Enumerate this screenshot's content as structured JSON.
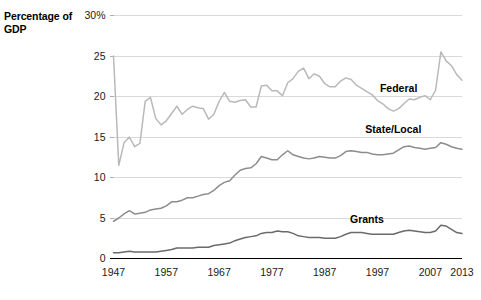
{
  "axis_title": "Percentage of GDP",
  "chart_data": {
    "type": "line",
    "title": "",
    "xlabel": "",
    "ylabel": "Percentage of GDP",
    "xlim": [
      1947,
      2013
    ],
    "ylim": [
      0,
      30
    ],
    "grid": true,
    "grid_axis": "y",
    "legend_position": "inline-labels",
    "y_ticks": [
      0,
      5,
      10,
      15,
      20,
      25,
      30
    ],
    "y_tick_labels": [
      "0",
      "5",
      "10",
      "15",
      "20",
      "25",
      "30%"
    ],
    "x_ticks": [
      1947,
      1957,
      1967,
      1977,
      1987,
      1997,
      2007,
      2013
    ],
    "x_tick_labels": [
      "1947",
      "1957",
      "1967",
      "1977",
      "1987",
      "1997",
      "2007",
      "2013"
    ],
    "x": [
      1947,
      1948,
      1949,
      1950,
      1951,
      1952,
      1953,
      1954,
      1955,
      1956,
      1957,
      1958,
      1959,
      1960,
      1961,
      1962,
      1963,
      1964,
      1965,
      1966,
      1967,
      1968,
      1969,
      1970,
      1971,
      1972,
      1973,
      1974,
      1975,
      1976,
      1977,
      1978,
      1979,
      1980,
      1981,
      1982,
      1983,
      1984,
      1985,
      1986,
      1987,
      1988,
      1989,
      1990,
      1991,
      1992,
      1993,
      1994,
      1995,
      1996,
      1997,
      1998,
      1999,
      2000,
      2001,
      2002,
      2003,
      2004,
      2005,
      2006,
      2007,
      2008,
      2009,
      2010,
      2011,
      2012,
      2013
    ],
    "series": [
      {
        "name": "Federal",
        "color": "#b9b9b9",
        "label_x": 2001,
        "label_y": 20.5,
        "values": [
          25.0,
          11.5,
          14.3,
          15.0,
          13.8,
          14.2,
          19.4,
          19.9,
          17.3,
          16.5,
          17.0,
          17.9,
          18.8,
          17.8,
          18.4,
          18.8,
          18.6,
          18.5,
          17.2,
          17.8,
          19.4,
          20.5,
          19.4,
          19.3,
          19.5,
          19.6,
          18.7,
          18.7,
          21.3,
          21.4,
          20.7,
          20.7,
          20.1,
          21.7,
          22.2,
          23.1,
          23.5,
          22.2,
          22.8,
          22.5,
          21.6,
          21.2,
          21.2,
          21.9,
          22.3,
          22.1,
          21.4,
          21.0,
          20.6,
          20.2,
          19.5,
          19.1,
          18.5,
          18.2,
          18.5,
          19.1,
          19.7,
          19.6,
          19.9,
          20.1,
          19.6,
          20.8,
          25.5,
          24.4,
          23.8,
          22.7,
          22.0
        ]
      },
      {
        "name": "State/Local",
        "color": "#8d8d8d",
        "label_x": 2000,
        "label_y": 15.5,
        "values": [
          4.6,
          5.0,
          5.5,
          5.9,
          5.5,
          5.6,
          5.7,
          6.0,
          6.1,
          6.2,
          6.5,
          7.0,
          7.0,
          7.2,
          7.5,
          7.5,
          7.7,
          7.9,
          8.0,
          8.4,
          9.0,
          9.4,
          9.6,
          10.3,
          10.9,
          11.1,
          11.2,
          11.7,
          12.6,
          12.4,
          12.2,
          12.2,
          12.8,
          13.3,
          12.8,
          12.6,
          12.4,
          12.3,
          12.4,
          12.6,
          12.5,
          12.4,
          12.4,
          12.7,
          13.2,
          13.3,
          13.2,
          13.1,
          13.1,
          12.9,
          12.8,
          12.8,
          12.9,
          13.0,
          13.4,
          13.8,
          13.9,
          13.7,
          13.6,
          13.5,
          13.6,
          13.7,
          14.3,
          14.1,
          13.8,
          13.6,
          13.5
        ]
      },
      {
        "name": "Grants",
        "color": "#6b6b6b",
        "label_x": 1995,
        "label_y": 4.4,
        "values": [
          0.7,
          0.7,
          0.8,
          0.9,
          0.8,
          0.8,
          0.8,
          0.8,
          0.8,
          0.9,
          1.0,
          1.1,
          1.3,
          1.3,
          1.3,
          1.3,
          1.4,
          1.4,
          1.4,
          1.6,
          1.7,
          1.8,
          1.9,
          2.2,
          2.4,
          2.6,
          2.7,
          2.8,
          3.1,
          3.2,
          3.2,
          3.4,
          3.3,
          3.3,
          3.1,
          2.8,
          2.7,
          2.6,
          2.6,
          2.6,
          2.5,
          2.5,
          2.5,
          2.7,
          3.0,
          3.2,
          3.2,
          3.2,
          3.1,
          3.0,
          3.0,
          3.0,
          3.0,
          3.0,
          3.2,
          3.4,
          3.5,
          3.4,
          3.3,
          3.2,
          3.2,
          3.4,
          4.1,
          4.0,
          3.6,
          3.2,
          3.1
        ]
      }
    ]
  }
}
